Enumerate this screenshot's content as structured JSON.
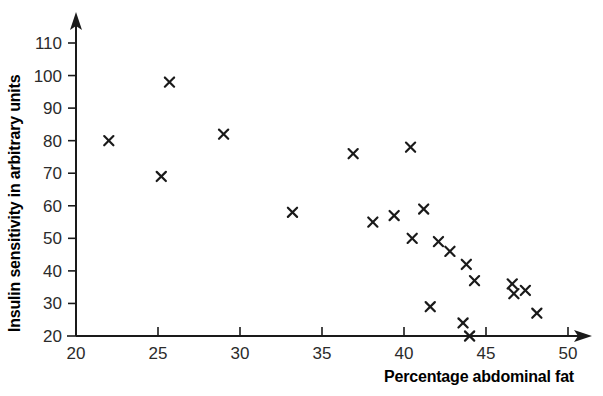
{
  "chart_data": {
    "type": "scatter",
    "title": "",
    "xlabel": "Percentage abdominal fat",
    "ylabel": "Insulin sensitivity in arbitrary units",
    "xlim": [
      20,
      50
    ],
    "ylim": [
      20,
      110
    ],
    "xticks": [
      20,
      25,
      30,
      35,
      40,
      45,
      50
    ],
    "yticks": [
      20,
      30,
      40,
      50,
      60,
      70,
      80,
      90,
      100,
      110
    ],
    "xtick_labels": [
      "20",
      "25",
      "30",
      "35",
      "40",
      "45",
      "50"
    ],
    "ytick_labels": [
      "20",
      "30",
      "40",
      "50",
      "60",
      "70",
      "80",
      "90",
      "100",
      "110"
    ],
    "grid": false,
    "legend": false,
    "marker": "x",
    "marker_color": "#1a1a1a",
    "axis_arrows": true,
    "points": [
      {
        "x": 22.0,
        "y": 80
      },
      {
        "x": 25.2,
        "y": 69
      },
      {
        "x": 25.7,
        "y": 98
      },
      {
        "x": 29.0,
        "y": 82
      },
      {
        "x": 33.2,
        "y": 58
      },
      {
        "x": 36.9,
        "y": 76
      },
      {
        "x": 38.1,
        "y": 55
      },
      {
        "x": 39.4,
        "y": 57
      },
      {
        "x": 40.4,
        "y": 78
      },
      {
        "x": 40.5,
        "y": 50
      },
      {
        "x": 41.2,
        "y": 59
      },
      {
        "x": 41.6,
        "y": 29
      },
      {
        "x": 42.1,
        "y": 49
      },
      {
        "x": 42.8,
        "y": 46
      },
      {
        "x": 43.6,
        "y": 24
      },
      {
        "x": 43.8,
        "y": 42
      },
      {
        "x": 44.0,
        "y": 20
      },
      {
        "x": 44.3,
        "y": 37
      },
      {
        "x": 46.6,
        "y": 36
      },
      {
        "x": 46.7,
        "y": 33
      },
      {
        "x": 47.4,
        "y": 34
      },
      {
        "x": 48.1,
        "y": 27
      }
    ]
  },
  "axes": {
    "x_axis_label": "Percentage abdominal fat",
    "y_axis_label": "Insulin sensitivity in arbitrary units"
  },
  "colors": {
    "ink": "#1a1a1a",
    "tick_text": "#2b2b2b",
    "background": "#ffffff"
  }
}
